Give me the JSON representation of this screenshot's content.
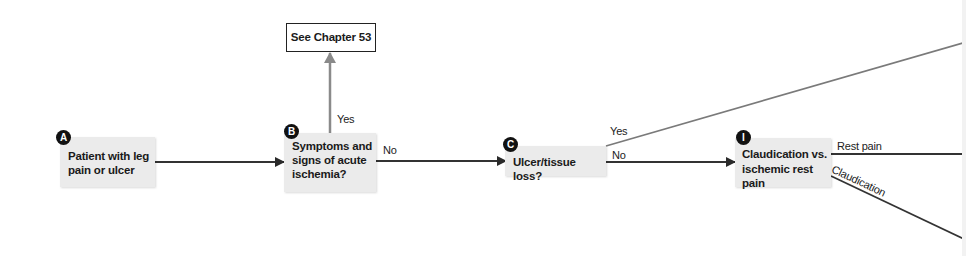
{
  "diagram": {
    "type": "flowchart",
    "nodes": {
      "a": {
        "badge": "A",
        "line1": "Patient with leg",
        "line2": "pain or ulcer"
      },
      "b": {
        "badge": "B",
        "line1": "Symptoms and",
        "line2": "signs of acute",
        "line3": "ischemia?"
      },
      "c": {
        "badge": "C",
        "line1": "Ulcer/tissue loss?"
      },
      "i": {
        "badge": "I",
        "line1": "Claudication vs.",
        "line2": "ischemic rest pain"
      },
      "chapter": {
        "label": "See Chapter 53"
      }
    },
    "edges": {
      "b_yes": "Yes",
      "b_no": "No",
      "c_yes": "Yes",
      "c_no": "No",
      "i_rest": "Rest pain",
      "i_claud": "Claudication"
    },
    "colors": {
      "node_fill": "#ebebeb",
      "badge": "#111111",
      "arrow_dark": "#333333",
      "arrow_grey": "#8a8a8a"
    }
  }
}
